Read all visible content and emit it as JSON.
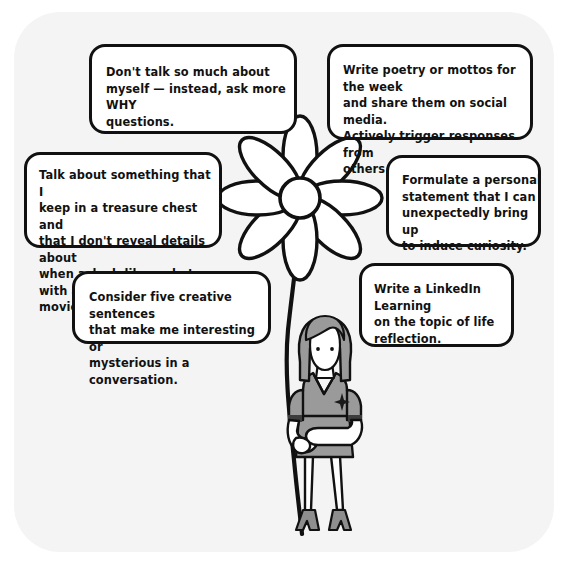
{
  "scene": {
    "title": "Hand-drawn idea sketch: woman holding a daisy with six note bubbles",
    "background_color": "#ffffff",
    "paper_color": "#f4f4f4",
    "ink_color": "#111111",
    "figure_fill": "#9a9a9a",
    "skin_fill": "#ffffff"
  },
  "notes": [
    {
      "id": "why-questions",
      "text": "Don't talk so much about\nmyself — instead, ask more WHY\nquestions."
    },
    {
      "id": "poetry-mottos",
      "text": "Write poetry or mottos for the week\nand share them on social media.\nActively trigger responses from\nothers with a question."
    },
    {
      "id": "treasure-chest",
      "text": "Talk about something that I\nkeep in a treasure chest and\nthat I don't reveal details about\nwhen asked, like a photo with a\nmovie star."
    },
    {
      "id": "personal-statement",
      "text": "Formulate a personal\nstatement that I can\nunexpectedly bring up\nto induce curiosity."
    },
    {
      "id": "creative-sentences",
      "text": "Consider five creative sentences\nthat make me interesting or\nmysterious in a conversation."
    },
    {
      "id": "linkedin-learning",
      "text": "Write a LinkedIn Learning\non the topic of life\nreflection."
    }
  ],
  "illustration": {
    "flower": {
      "name": "daisy-flower",
      "petal_count": 8,
      "petal_fill": "#ffffff",
      "center_fill": "#ffffff"
    },
    "stem": {
      "name": "flower-stem",
      "color": "#111111"
    },
    "person": {
      "name": "woman-figure",
      "hair_fill": "#9a9a9a",
      "dress_fill": "#9a9a9a",
      "shoes_fill": "#8e8e8e",
      "badge": "emblem-pin"
    }
  }
}
